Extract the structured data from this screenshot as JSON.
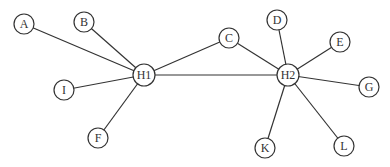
{
  "diagram": {
    "type": "network-graph",
    "colors": {
      "stroke": "#333333",
      "fill": "#ffffff",
      "text": "#333333"
    },
    "nodes": [
      {
        "id": "A",
        "label": "A",
        "x": 24,
        "y": 24,
        "r": 10
      },
      {
        "id": "B",
        "label": "B",
        "x": 84,
        "y": 22,
        "r": 10
      },
      {
        "id": "I",
        "label": "I",
        "x": 64,
        "y": 90,
        "r": 10
      },
      {
        "id": "F",
        "label": "F",
        "x": 98,
        "y": 138,
        "r": 10
      },
      {
        "id": "H1",
        "label": "H1",
        "x": 144,
        "y": 75,
        "r": 11
      },
      {
        "id": "C",
        "label": "C",
        "x": 229,
        "y": 38,
        "r": 10
      },
      {
        "id": "H2",
        "label": "H2",
        "x": 288,
        "y": 75,
        "r": 11
      },
      {
        "id": "D",
        "label": "D",
        "x": 277,
        "y": 20,
        "r": 10
      },
      {
        "id": "E",
        "label": "E",
        "x": 340,
        "y": 42,
        "r": 10
      },
      {
        "id": "G",
        "label": "G",
        "x": 369,
        "y": 87,
        "r": 10
      },
      {
        "id": "K",
        "label": "K",
        "x": 265,
        "y": 148,
        "r": 10
      },
      {
        "id": "L",
        "label": "L",
        "x": 344,
        "y": 146,
        "r": 10
      }
    ],
    "edges": [
      [
        "A",
        "H1"
      ],
      [
        "B",
        "H1"
      ],
      [
        "I",
        "H1"
      ],
      [
        "F",
        "H1"
      ],
      [
        "H1",
        "C"
      ],
      [
        "H1",
        "H2"
      ],
      [
        "C",
        "H2"
      ],
      [
        "D",
        "H2"
      ],
      [
        "E",
        "H2"
      ],
      [
        "G",
        "H2"
      ],
      [
        "K",
        "H2"
      ],
      [
        "L",
        "H2"
      ]
    ]
  }
}
